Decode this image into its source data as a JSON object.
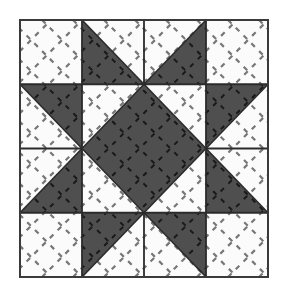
{
  "figure": {
    "name": "quilt-block-diagram",
    "canvas": {
      "width": 283,
      "height": 290,
      "background": "#ffffff"
    }
  },
  "colors": {
    "fabric_light": "#fbfbfb",
    "fabric_dark": "#4f4f4f",
    "seam_line": "#2b2b2b",
    "outer_border": "#3a3a3a",
    "quilting_stitch_light": "#777777",
    "quilting_stitch_dark": "#1a1a1a",
    "background": "#ffffff"
  },
  "block": {
    "label": "Star block",
    "x": 20,
    "y": 20,
    "width": 248,
    "height": 257,
    "grid_columns": 4,
    "grid_rows": 4,
    "cell_width": 62,
    "cell_height": 64.25,
    "border_width": 2
  },
  "quilting": {
    "label": "Cross-hatch quilting",
    "angle_degrees": 45,
    "spacing": 31,
    "dash_pattern": "5 6",
    "stroke_width": 2.2
  },
  "patches": [
    {
      "id": "corner-top-left",
      "label": "Corner square, top left",
      "shape": "square",
      "fabric": "light",
      "points": "20,20 82,20 82,84.25 20,84.25"
    },
    {
      "id": "corner-top-right",
      "label": "Corner square, top right",
      "shape": "square",
      "fabric": "light",
      "points": "206,20 268,20 268,84.25 206,84.25"
    },
    {
      "id": "corner-bottom-left",
      "label": "Corner square, bottom left",
      "shape": "square",
      "fabric": "light",
      "points": "20,212.75 82,212.75 82,277 20,277"
    },
    {
      "id": "corner-bottom-right",
      "label": "Corner square, bottom right",
      "shape": "square",
      "fabric": "light",
      "points": "206,212.75 268,212.75 268,277 206,277"
    },
    {
      "id": "star-point-top-left",
      "label": "Star point triangle, top left",
      "shape": "triangle",
      "fabric": "dark",
      "points": "82,20 82,84.25 144,84.25"
    },
    {
      "id": "star-point-top-left-bg",
      "label": "Background triangle, top left",
      "shape": "triangle",
      "fabric": "light",
      "points": "82,20 144,20 144,84.25"
    },
    {
      "id": "star-point-top-right",
      "label": "Star point triangle, top right",
      "shape": "triangle",
      "fabric": "dark",
      "points": "206,20 206,84.25 144,84.25"
    },
    {
      "id": "star-point-top-right-bg",
      "label": "Background triangle, top right",
      "shape": "triangle",
      "fabric": "light",
      "points": "206,20 144,20 144,84.25"
    },
    {
      "id": "star-point-left-top",
      "label": "Star point triangle, left upper",
      "shape": "triangle",
      "fabric": "dark",
      "points": "20,84.25 82,84.25 82,148.5"
    },
    {
      "id": "star-point-left-top-bg",
      "label": "Background triangle, left upper",
      "shape": "triangle",
      "fabric": "light",
      "points": "20,84.25 20,148.5 82,148.5"
    },
    {
      "id": "star-point-left-bottom",
      "label": "Star point triangle, left lower",
      "shape": "triangle",
      "fabric": "dark",
      "points": "20,212.75 82,212.75 82,148.5"
    },
    {
      "id": "star-point-left-bottom-bg",
      "label": "Background triangle, left lower",
      "shape": "triangle",
      "fabric": "light",
      "points": "20,212.75 20,148.5 82,148.5"
    },
    {
      "id": "star-point-right-top",
      "label": "Star point triangle, right upper",
      "shape": "triangle",
      "fabric": "dark",
      "points": "268,84.25 206,84.25 206,148.5"
    },
    {
      "id": "star-point-right-top-bg",
      "label": "Background triangle, right upper",
      "shape": "triangle",
      "fabric": "light",
      "points": "268,84.25 268,148.5 206,148.5"
    },
    {
      "id": "star-point-right-bottom",
      "label": "Star point triangle, right lower",
      "shape": "triangle",
      "fabric": "dark",
      "points": "268,212.75 206,212.75 206,148.5"
    },
    {
      "id": "star-point-right-bottom-bg",
      "label": "Background triangle, right lower",
      "shape": "triangle",
      "fabric": "light",
      "points": "268,212.75 268,148.5 206,148.5"
    },
    {
      "id": "star-point-bottom-left",
      "label": "Star point triangle, bottom left",
      "shape": "triangle",
      "fabric": "dark",
      "points": "82,277 82,212.75 144,212.75"
    },
    {
      "id": "star-point-bottom-left-bg",
      "label": "Background triangle, bottom left",
      "shape": "triangle",
      "fabric": "light",
      "points": "82,277 144,277 144,212.75"
    },
    {
      "id": "star-point-bottom-right",
      "label": "Star point triangle, bottom right",
      "shape": "triangle",
      "fabric": "dark",
      "points": "206,277 206,212.75 144,212.75"
    },
    {
      "id": "star-point-bottom-right-bg",
      "label": "Background triangle, bottom right",
      "shape": "triangle",
      "fabric": "light",
      "points": "206,277 144,277 144,212.75"
    },
    {
      "id": "center-field",
      "label": "Centre square field",
      "shape": "square",
      "fabric": "light",
      "points": "82,84.25 206,84.25 206,212.75 82,212.75"
    },
    {
      "id": "center-diamond",
      "label": "Centre diamond on point",
      "shape": "diamond",
      "fabric": "dark",
      "points": "144,84.25 206,148.5 144,212.75 82,148.5"
    }
  ],
  "seam_lines": [
    {
      "id": "grid-v1",
      "label": "Vertical seam 1",
      "x1": 82,
      "y1": 20,
      "x2": 82,
      "y2": 277
    },
    {
      "id": "grid-v2",
      "label": "Vertical seam 2",
      "x1": 144,
      "y1": 20,
      "x2": 144,
      "y2": 84.25
    },
    {
      "id": "grid-v3",
      "label": "Vertical seam 3",
      "x1": 144,
      "y1": 212.75,
      "x2": 144,
      "y2": 277
    },
    {
      "id": "grid-v4",
      "label": "Vertical seam 4",
      "x1": 206,
      "y1": 20,
      "x2": 206,
      "y2": 277
    },
    {
      "id": "grid-h1",
      "label": "Horizontal seam 1",
      "x1": 20,
      "y1": 84.25,
      "x2": 268,
      "y2": 84.25
    },
    {
      "id": "grid-h2",
      "label": "Horizontal seam 2",
      "x1": 20,
      "y1": 148.5,
      "x2": 82,
      "y2": 148.5
    },
    {
      "id": "grid-h3",
      "label": "Horizontal seam 3",
      "x1": 206,
      "y1": 148.5,
      "x2": 268,
      "y2": 148.5
    },
    {
      "id": "grid-h4",
      "label": "Horizontal seam 4",
      "x1": 20,
      "y1": 212.75,
      "x2": 268,
      "y2": 212.75
    }
  ],
  "diagonal_seams": [
    {
      "id": "diag-tl",
      "label": "Diagonal seam, top left cell",
      "x1": 82,
      "y1": 20,
      "x2": 144,
      "y2": 84.25
    },
    {
      "id": "diag-tr",
      "label": "Diagonal seam, top right cell",
      "x1": 206,
      "y1": 20,
      "x2": 144,
      "y2": 84.25
    },
    {
      "id": "diag-lt",
      "label": "Diagonal seam, left upper cell",
      "x1": 20,
      "y1": 84.25,
      "x2": 82,
      "y2": 148.5
    },
    {
      "id": "diag-lb",
      "label": "Diagonal seam, left lower cell",
      "x1": 20,
      "y1": 212.75,
      "x2": 82,
      "y2": 148.5
    },
    {
      "id": "diag-rt",
      "label": "Diagonal seam, right upper cell",
      "x1": 268,
      "y1": 84.25,
      "x2": 206,
      "y2": 148.5
    },
    {
      "id": "diag-rb",
      "label": "Diagonal seam, right lower cell",
      "x1": 268,
      "y1": 212.75,
      "x2": 206,
      "y2": 148.5
    },
    {
      "id": "diag-bl",
      "label": "Diagonal seam, bottom left cell",
      "x1": 82,
      "y1": 277,
      "x2": 144,
      "y2": 212.75
    },
    {
      "id": "diag-br",
      "label": "Diagonal seam, bottom right cell",
      "x1": 206,
      "y1": 277,
      "x2": 144,
      "y2": 212.75
    },
    {
      "id": "diag-cd-ne",
      "label": "Centre diamond seam, north east",
      "x1": 144,
      "y1": 84.25,
      "x2": 206,
      "y2": 148.5
    },
    {
      "id": "diag-cd-se",
      "label": "Centre diamond seam, south east",
      "x1": 206,
      "y1": 148.5,
      "x2": 144,
      "y2": 212.75
    },
    {
      "id": "diag-cd-sw",
      "label": "Centre diamond seam, south west",
      "x1": 144,
      "y1": 212.75,
      "x2": 82,
      "y2": 148.5
    },
    {
      "id": "diag-cd-nw",
      "label": "Centre diamond seam, north west",
      "x1": 82,
      "y1": 148.5,
      "x2": 144,
      "y2": 84.25
    }
  ]
}
